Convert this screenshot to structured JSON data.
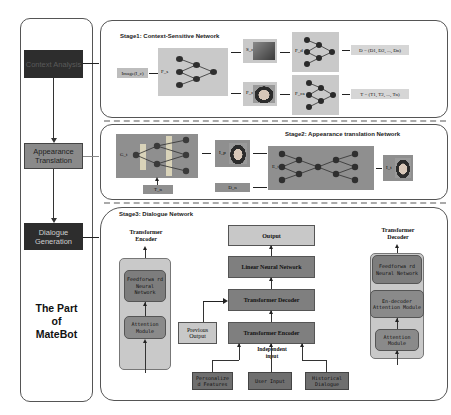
{
  "left_panel": {
    "modules": [
      {
        "label": "Context Analysis",
        "color": "#2d2d2d"
      },
      {
        "label": "Appearance Translation",
        "color": "#8a8a8a"
      },
      {
        "label": "Dialogue Generation",
        "color": "#2d2d2d"
      }
    ],
    "title_line1": "The Part",
    "title_line2": "of",
    "title_line3": "MateBot"
  },
  "stage1": {
    "title": "Stage1: Context-Sensitive Network",
    "input_label": "Image(I_c)",
    "encoder_label": "F_s",
    "scene_label": "S_c",
    "face_label": "F_c",
    "scene_net_label": "F_d",
    "face_net_label": "F_ca",
    "output_d": "D = (D1, D2, ..., Dn)",
    "output_t": "T = (T1, T2, ..., Tn)"
  },
  "stage2": {
    "title": "Stage2: Appearance translation Network",
    "generator_label": "G_t",
    "input_t_label": "T_n",
    "output_face_label": "I_p",
    "input_d_label": "D_n",
    "refiner_label": "E_t",
    "final_label": "I_t"
  },
  "stage3": {
    "title": "Stage3: Dialogue Network",
    "encoder": {
      "caption_line1": "Transformer",
      "caption_line2": "Encoder",
      "blocks": [
        "Feedforwa rd Neural Network",
        "Attention Module"
      ]
    },
    "center": {
      "output": "Output",
      "linear": "Linear Neural Network",
      "decoder": "Transformer Decoder",
      "encoder": "Transformer Encoder",
      "previous_output_line1": "Previous",
      "previous_output_line2": "Output",
      "independent_input_line1": "Independent",
      "independent_input_line2": "input",
      "inputs": [
        "Personalize d Features",
        "User Input",
        "Historical Dialogue"
      ]
    },
    "decoder": {
      "caption_line1": "Transformer",
      "caption_line2": "Decoder",
      "blocks": [
        "Feedforwa rd Neural Network",
        "En-decoder Attention Module",
        "Attention Module"
      ]
    }
  }
}
